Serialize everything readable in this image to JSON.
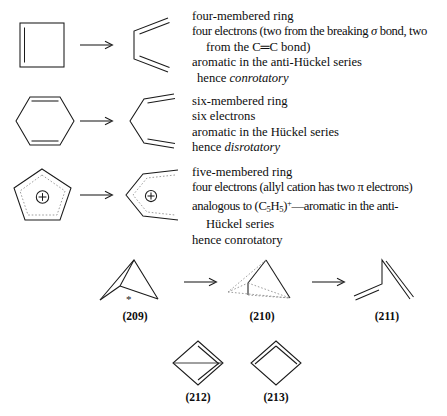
{
  "document": {
    "type": "chemistry-textbook-figure",
    "background_color": "#ffffff",
    "text_color": "#111111",
    "line_color": "#1a1a1a"
  },
  "reactions": [
    {
      "id": "four-membered",
      "reactant_name": "cyclobutene",
      "product_name": "butadiene",
      "arrow": "→",
      "notes": [
        {
          "text": "four-membered ring",
          "indent": false
        },
        {
          "text": "four electrons (two from the breaking σ bond, two",
          "indent": false
        },
        {
          "text": "from the C═C bond)",
          "indent": true
        },
        {
          "text": "aromatic in the anti-Hückel series",
          "indent": false
        },
        {
          "text": "hence conrotatory",
          "indent": false,
          "italic_tail": "conrotatory",
          "lead": "hence "
        }
      ]
    },
    {
      "id": "six-membered",
      "reactant_name": "cyclohexadiene",
      "product_name": "hexatriene",
      "arrow": "→",
      "notes": [
        {
          "text": "six-membered ring",
          "indent": false
        },
        {
          "text": "six electrons",
          "indent": false
        },
        {
          "text": "aromatic in the Hückel series",
          "indent": false
        },
        {
          "text": "hence disrotatory",
          "indent": false,
          "italic_tail": "disrotatory",
          "lead": "hence "
        }
      ]
    },
    {
      "id": "five-membered",
      "reactant_name": "cyclopentenyl cation",
      "product_name": "pentadienyl cation",
      "arrow": "→",
      "charge_symbol": "⊕",
      "notes": [
        {
          "text": "five-membered ring",
          "indent": false
        },
        {
          "text": "four electrons (allyl cation has two π electrons)",
          "indent": false
        },
        {
          "text": "analogous to (C5H5)+—aromatic in the anti-",
          "indent": false
        },
        {
          "text": "Hückel series",
          "indent": true
        },
        {
          "text": "hence conrotatory",
          "indent": false
        }
      ]
    }
  ],
  "text_blocks": {
    "block1": {
      "line1": "four-membered ring",
      "line2_a": "four electrons (two from the breaking ",
      "line2_sigma": "σ",
      "line2_b": " bond, two",
      "line3": "from the C═C bond)",
      "line4": "aromatic in the anti-Hückel series",
      "line5_lead": "hence ",
      "line5_italic": "conrotatory"
    },
    "block2": {
      "line1": "six-membered ring",
      "line2": "six electrons",
      "line3": "aromatic in the Hückel series",
      "line4_lead": "hence ",
      "line4_italic": "disrotatory"
    },
    "block3": {
      "line1": "five-membered ring",
      "line2_a": "four electrons (allyl cation has two ",
      "line2_pi": "π",
      "line2_b": " electrons)",
      "line3_a": "analogous to (C",
      "line3_sub1": "5",
      "line3_b": "H",
      "line3_sub2": "5",
      "line3_c": ")",
      "line3_sup": "+",
      "line3_d": "—aromatic in the anti-",
      "line4": "Hückel series",
      "line5": "hence conrotatory"
    }
  },
  "scheme": {
    "top_sequence": [
      {
        "label": "(209)",
        "name": "bicyclo-pentene-housane",
        "marks": [
          "*",
          "*"
        ]
      },
      {
        "label": "(210)",
        "name": "diradical-transition-state"
      },
      {
        "label": "(211)",
        "name": "butadiene-open-form"
      }
    ],
    "arrows": [
      "→",
      "→"
    ],
    "bottom_sequence": [
      {
        "label": "(212)",
        "name": "bicyclobutane"
      },
      {
        "label": "(213)",
        "name": "cyclobutadiene"
      }
    ],
    "marks": {
      "asterisk": "*"
    }
  }
}
